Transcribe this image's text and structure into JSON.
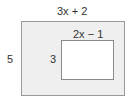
{
  "diagram": {
    "outer_rectangle": {
      "width_label": "3x + 2",
      "height_label": "5",
      "fill": "#efefef",
      "stroke": "#9a9a9a"
    },
    "inner_rectangle": {
      "width_label": "2x − 1",
      "height_label": "3",
      "fill": "#ffffff",
      "stroke": "#8a8a8a"
    }
  }
}
